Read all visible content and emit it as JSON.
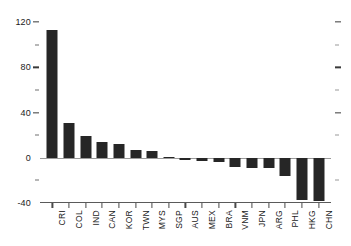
{
  "chart_data": {
    "type": "bar",
    "title": "",
    "subtitle": "",
    "xlabel": "",
    "ylabel": "",
    "ylim": [
      -40,
      120
    ],
    "grid": false,
    "legend": null,
    "y_major_ticks": [
      120,
      80,
      40,
      0,
      -40
    ],
    "y_major_labels": [
      "120",
      "80",
      "40",
      "0",
      "-40"
    ],
    "y_minor_ticks": [
      100,
      60,
      20,
      -20
    ],
    "categories": [
      "CRI",
      "COL",
      "IND",
      "CAN",
      "KOR",
      "TWN",
      "MYS",
      "SGP",
      "AUS",
      "MEX",
      "BRA",
      "VNM",
      "JPN",
      "ARG",
      "PHL",
      "HKG",
      "CHN"
    ],
    "values": [
      113,
      31,
      19,
      14,
      12,
      7,
      6,
      0.5,
      -2,
      -2.5,
      -4,
      -8,
      -9,
      -9.5,
      -16,
      -37,
      -38
    ],
    "bar_color": "#262626",
    "axis_color": "#4a4a4a",
    "zero_line_color": "#9a9a9a",
    "background_color": "#ffffff"
  }
}
